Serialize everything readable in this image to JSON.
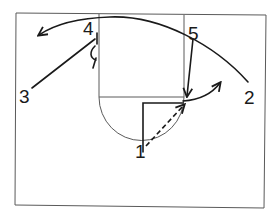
{
  "diagram": {
    "type": "basketball-play",
    "court": {
      "frame": {
        "x1": 16,
        "y1": 13,
        "x2": 266,
        "y2": 207
      },
      "lane": {
        "left": 99,
        "right": 184,
        "top": 14,
        "bottom": 97
      },
      "free_throw_circle": {
        "cx": 141,
        "cy": 97,
        "r": 43
      },
      "line_color": "#5a5a5a"
    },
    "players": [
      {
        "id": "1",
        "label": "1",
        "x": 135,
        "y": 158
      },
      {
        "id": "2",
        "label": "2",
        "x": 244,
        "y": 104
      },
      {
        "id": "3",
        "label": "3",
        "x": 19,
        "y": 103
      },
      {
        "id": "4",
        "label": "4",
        "x": 83,
        "y": 35
      },
      {
        "id": "5",
        "label": "5",
        "x": 188,
        "y": 40
      }
    ],
    "ink_color": "#1a1a1a"
  }
}
